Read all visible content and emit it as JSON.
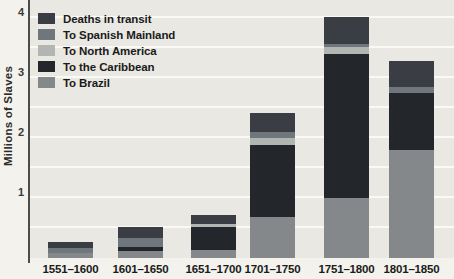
{
  "page": {
    "background": "#f3f2ed",
    "plot_background": "#e9e8e3",
    "gridline_color": "#f9f9f5",
    "axis_line_color": "#4c4c49",
    "text_color": "#1b1b1a"
  },
  "y_axis": {
    "title": "Millions of Slaves",
    "ticks": [
      {
        "label": "4",
        "value": 4
      },
      {
        "label": "3",
        "value": 3
      },
      {
        "label": "2",
        "value": 2
      },
      {
        "label": "1",
        "value": 1
      }
    ]
  },
  "legend": [
    {
      "label": "Deaths in transit",
      "color": "#3a3e44",
      "series_key": "deaths"
    },
    {
      "label": "To Spanish Mainland",
      "color": "#6f777c",
      "series_key": "spanish_mainland"
    },
    {
      "label": "To North America",
      "color": "#b2b6b2",
      "series_key": "north_america"
    },
    {
      "label": "To the Caribbean",
      "color": "#23262a",
      "series_key": "caribbean"
    },
    {
      "label": "To Brazil",
      "color": "#84888a",
      "series_key": "brazil"
    }
  ],
  "chart_data": {
    "type": "bar",
    "stacked": true,
    "title": "",
    "xlabel": "",
    "ylabel": "Millions of Slaves",
    "ylim": [
      0,
      4
    ],
    "gridline_interval": 0.5,
    "grid": true,
    "legend_position": "top-left",
    "categories": [
      "1551–1600",
      "1601–1650",
      "1651–1700",
      "1701–1750",
      "1751–1800",
      "1801–1850"
    ],
    "series": [
      {
        "name": "To Brazil",
        "key": "brazil",
        "color": "#84888a",
        "values": [
          0.08,
          0.12,
          0.13,
          0.68,
          1.0,
          1.8
        ]
      },
      {
        "name": "To the Caribbean",
        "key": "caribbean",
        "color": "#23262a",
        "values": [
          0.0,
          0.07,
          0.39,
          1.2,
          2.4,
          0.95
        ]
      },
      {
        "name": "To North America",
        "key": "north_america",
        "color": "#b2b6b2",
        "values": [
          0.0,
          0.0,
          0.04,
          0.12,
          0.12,
          0.0
        ]
      },
      {
        "name": "To Spanish Mainland",
        "key": "spanish_mainland",
        "color": "#6f777c",
        "values": [
          0.08,
          0.15,
          0.0,
          0.1,
          0.05,
          0.1
        ]
      },
      {
        "name": "Deaths in transit",
        "key": "deaths",
        "color": "#3a3e44",
        "values": [
          0.11,
          0.18,
          0.15,
          0.32,
          0.45,
          0.43
        ]
      }
    ],
    "totals": [
      0.27,
      0.52,
      0.71,
      2.42,
      4.02,
      3.28
    ]
  }
}
